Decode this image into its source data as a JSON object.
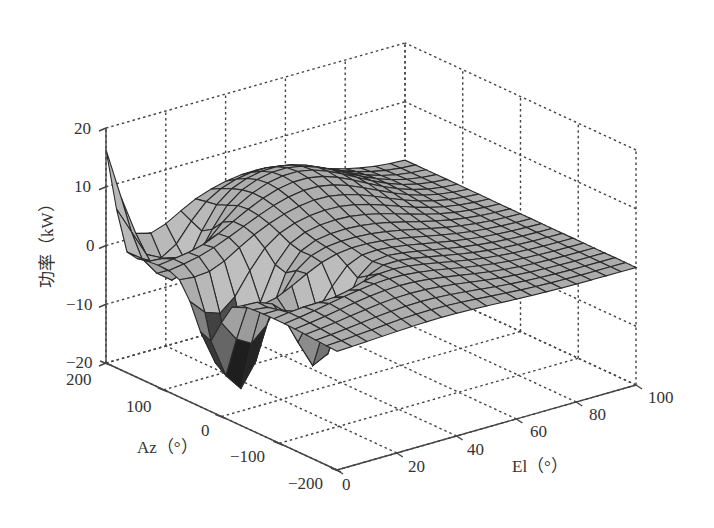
{
  "chart_data": {
    "type": "surface3d",
    "title": "",
    "xlabel": "El（°）",
    "ylabel": "Az（°）",
    "zlabel": "功率（kW）",
    "x_axis": {
      "name": "El",
      "unit": "°",
      "range": [
        0,
        100
      ],
      "ticks": [
        0,
        20,
        40,
        60,
        80,
        100
      ]
    },
    "y_axis": {
      "name": "Az",
      "unit": "°",
      "range": [
        -200,
        200
      ],
      "ticks": [
        -200,
        -100,
        0,
        100,
        200
      ]
    },
    "z_axis": {
      "name": "功率",
      "unit": "kW",
      "range": [
        -20,
        20
      ],
      "ticks": [
        -20,
        -10,
        0,
        10,
        20
      ]
    },
    "grid": true,
    "colormap": "gray",
    "surface_description": "Gridded power surface over Az [-200,200] and El [0,100]; broad hump near Az≈100..200 mid El rising to ~8 kW, secondary ridge ~2 kW along mid Az, tapering to ~0 at El=100; sharp negative troughs near Az≈0..50 low El reaching about -19 kW and -14 kW; sharp positive spike ~14 kW at Az=200, El≈0.",
    "sample_points": [
      {
        "az": 200,
        "el": 0,
        "power": 14
      },
      {
        "az": 200,
        "el": 10,
        "power": -2
      },
      {
        "az": 150,
        "el": 20,
        "power": -9
      },
      {
        "az": 100,
        "el": 45,
        "power": 8
      },
      {
        "az": 150,
        "el": 60,
        "power": 8
      },
      {
        "az": 50,
        "el": 40,
        "power": 2
      },
      {
        "az": 25,
        "el": 10,
        "power": -19
      },
      {
        "az": -25,
        "el": 15,
        "power": 3
      },
      {
        "az": -50,
        "el": 20,
        "power": -14
      },
      {
        "az": -100,
        "el": 60,
        "power": -3
      },
      {
        "az": -150,
        "el": 100,
        "power": 0
      },
      {
        "az": 0,
        "el": 100,
        "power": 0
      }
    ]
  },
  "axes": {
    "z_ticks": [
      "20",
      "10",
      "0",
      "−10",
      "−20"
    ],
    "az_ticks": [
      "200",
      "100",
      "0",
      "−100",
      "−200"
    ],
    "el_ticks": [
      "0",
      "20",
      "40",
      "60",
      "80",
      "100"
    ],
    "z_label": "功率（kW）",
    "az_label": "Az（°）",
    "el_label": "El（°）"
  },
  "colors": {
    "background": "#ffffff",
    "axis": "#444444",
    "surface_light": "#c8c8c8",
    "surface_mid": "#9a9a9a",
    "surface_dark": "#1e1e1e",
    "mesh": "#2a2a2a"
  }
}
